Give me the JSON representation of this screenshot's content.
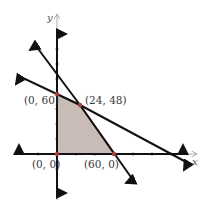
{
  "diagram": {
    "type": "linear-programming-feasible-region",
    "axes": {
      "x_label": "x",
      "y_label": "y"
    },
    "vertices": [
      {
        "label": "(0, 0)",
        "x": 0,
        "y": 0
      },
      {
        "label": "(60, 0)",
        "x": 60,
        "y": 0
      },
      {
        "label": "(24, 48)",
        "x": 24,
        "y": 48
      },
      {
        "label": "(0, 60)",
        "x": 0,
        "y": 60
      }
    ],
    "colors": {
      "region_fill": "#c9bcb6",
      "region_edge": "#a8403a",
      "vertex_dot": "#a8403a",
      "line": "#111111",
      "axis": "#9a9a9a"
    }
  }
}
